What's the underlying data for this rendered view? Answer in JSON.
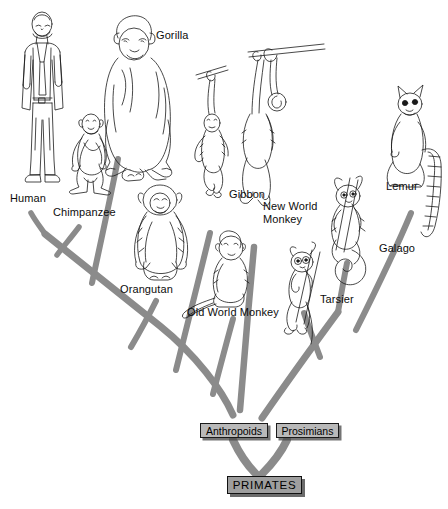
{
  "figure": {
    "branch_color": "#8b8b8b",
    "box_fill": "#b9b9b9",
    "root_box_fill": "#9e9e9e",
    "background": "#ffffff",
    "ink_color": "#111111"
  },
  "taxa": [
    {
      "id": "human",
      "label": "Human",
      "label_x": 10,
      "label_y": 192,
      "tip_x": 30,
      "tip_y": 212
    },
    {
      "id": "chimpanzee",
      "label": "Chimpanzee",
      "label_x": 53,
      "label_y": 206,
      "tip_x": 78,
      "tip_y": 226
    },
    {
      "id": "gorilla",
      "label": "Gorilla",
      "label_x": 156,
      "label_y": 29,
      "tip_x": 117,
      "tip_y": 158
    },
    {
      "id": "orangutan",
      "label": "Orangutan",
      "label_x": 120,
      "label_y": 283,
      "tip_x": 155,
      "tip_y": 300
    },
    {
      "id": "gibbon",
      "label": "Gibbon",
      "label_x": 229,
      "label_y": 188,
      "tip_x": 209,
      "tip_y": 232
    },
    {
      "id": "new-world-monkey",
      "label": "New World\nMonkey",
      "label_x": 263,
      "label_y": 200,
      "tip_x": 253,
      "tip_y": 246
    },
    {
      "id": "old-world-monkey",
      "label": "Old World Monkey",
      "label_x": 187,
      "label_y": 306,
      "tip_x": 232,
      "tip_y": 318
    },
    {
      "id": "tarsier",
      "label": "Tarsier",
      "label_x": 320,
      "label_y": 293,
      "tip_x": 303,
      "tip_y": 312
    },
    {
      "id": "galago",
      "label": "Galago",
      "label_x": 379,
      "label_y": 242,
      "tip_x": 346,
      "tip_y": 262
    },
    {
      "id": "lemur",
      "label": "Lemur",
      "label_x": 386,
      "label_y": 180,
      "tip_x": 412,
      "tip_y": 212
    }
  ],
  "clades": [
    {
      "id": "anthropoids",
      "label": "Anthropoids",
      "x": 200,
      "y": 423,
      "w": 68,
      "h": 15
    },
    {
      "id": "prosimians",
      "label": "Prosimians",
      "x": 276,
      "y": 423,
      "w": 63,
      "h": 15
    }
  ],
  "root": {
    "id": "primates",
    "label": "PRIMATES",
    "x": 227,
    "y": 476,
    "w": 75,
    "h": 18
  }
}
